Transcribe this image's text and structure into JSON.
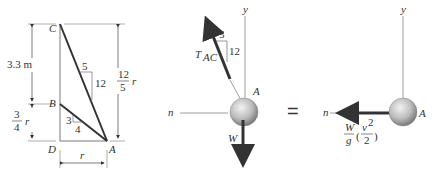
{
  "geometry": {
    "points": {
      "A": "A",
      "B": "B",
      "C": "C",
      "D": "D"
    },
    "dim_CB": "3.3 m",
    "dim_BD_num": "3",
    "dim_BD_den": "4",
    "dim_BD_var": "r",
    "dim_CA_num": "12",
    "dim_CA_den": "5",
    "dim_CA_var": "r",
    "dim_DA": "r",
    "slope_CA_run": "5",
    "slope_CA_rise": "12",
    "slope_BA_rise": "3",
    "slope_BA_run": "4"
  },
  "fbd": {
    "axis_y": "y",
    "axis_n": "n",
    "point": "A",
    "tension_label": "T",
    "tension_sub": "AC",
    "slope_run": "5",
    "slope_rise": "12",
    "weight": "W"
  },
  "equals": "=",
  "kinetic": {
    "axis_y": "y",
    "axis_n": "n",
    "point": "A",
    "term_num": "W",
    "term_den": "g",
    "v_num": "v",
    "v_exp": "2",
    "v_den": "2"
  },
  "colors": {
    "line": "#333333",
    "sphere": "#bdbdbd",
    "thin": "#888888"
  }
}
